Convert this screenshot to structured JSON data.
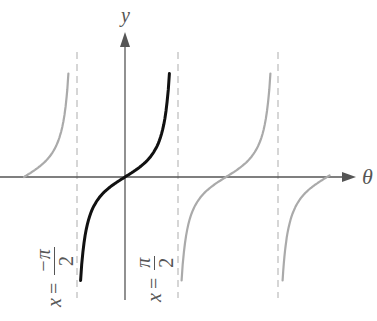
{
  "chart_data": {
    "type": "line",
    "title": "",
    "function": "tan(theta)",
    "xlabel": "θ",
    "ylabel": "y",
    "grid": false,
    "legend": null,
    "x_range_radians": [
      -2.5,
      5.0
    ],
    "asymptotes": [
      {
        "x": "-π/2",
        "label": "x = −π/2",
        "style": "dashed"
      },
      {
        "x": "π/2",
        "label": "x = π/2",
        "style": "dashed"
      },
      {
        "x": "3π/2",
        "label": "",
        "style": "dashed"
      }
    ],
    "series": [
      {
        "name": "principal branch (−π/2, π/2)",
        "color": "#111111",
        "emphasis": "bold",
        "theta_domain": [
          -1.38,
          1.38
        ],
        "zero_at": 0
      },
      {
        "name": "branch (−3π/2, −π/2)",
        "color": "#aaaaaa",
        "emphasis": "faint",
        "theta_domain": [
          -3.14,
          -1.76
        ],
        "zero_at": "-π"
      },
      {
        "name": "branch (π/2, 3π/2)",
        "color": "#aaaaaa",
        "emphasis": "faint",
        "theta_domain": [
          1.76,
          4.52
        ],
        "zero_at": "π"
      },
      {
        "name": "branch (3π/2, 5π/2)",
        "color": "#aaaaaa",
        "emphasis": "faint",
        "theta_domain": [
          4.9,
          6.28
        ],
        "zero_at": "2π"
      }
    ]
  },
  "labels": {
    "y_axis": "y",
    "x_axis": "θ",
    "left_asymptote": {
      "lhs": "x",
      "eq": "=",
      "num": "−π",
      "den": "2"
    },
    "right_asymptote": {
      "lhs": "x",
      "eq": "=",
      "num": "π",
      "den": "2"
    }
  },
  "colors": {
    "axis": "#555555",
    "principal_curve": "#111111",
    "other_curves": "#aaaaaa",
    "asymptote": "#bbbbbb"
  }
}
